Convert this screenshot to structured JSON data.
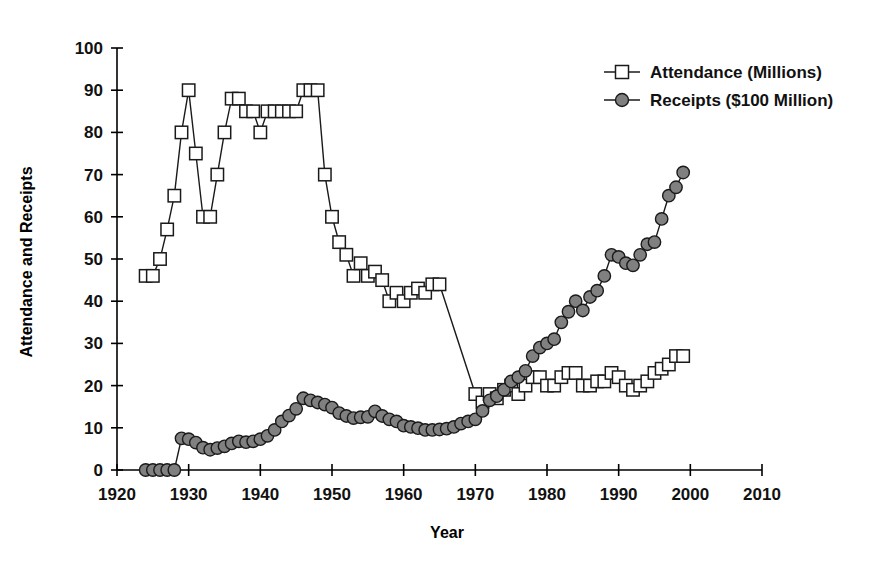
{
  "chart_data": {
    "type": "line",
    "title": "",
    "xlabel": "Year",
    "ylabel": "Attendance and Receipts",
    "xlim": [
      1920,
      2010
    ],
    "ylim": [
      0,
      100
    ],
    "xticks": [
      1920,
      1930,
      1940,
      1950,
      1960,
      1970,
      1980,
      1990,
      2000,
      2010
    ],
    "yticks": [
      0,
      10,
      20,
      30,
      40,
      50,
      60,
      70,
      80,
      90,
      100
    ],
    "grid": false,
    "legend_position": "top-right",
    "series": [
      {
        "name": "Attendance (Millions)",
        "marker": "open-square",
        "marker_color": "#ffffff",
        "line_color": "#1a1a1a",
        "x": [
          1924,
          1925,
          1926,
          1927,
          1928,
          1929,
          1930,
          1931,
          1932,
          1933,
          1934,
          1935,
          1936,
          1937,
          1938,
          1939,
          1940,
          1941,
          1942,
          1943,
          1944,
          1945,
          1946,
          1947,
          1948,
          1949,
          1950,
          1951,
          1952,
          1953,
          1954,
          1955,
          1956,
          1957,
          1958,
          1959,
          1960,
          1961,
          1962,
          1963,
          1964,
          1965,
          1970,
          1971,
          1972,
          1973,
          1974,
          1975,
          1976,
          1977,
          1978,
          1979,
          1980,
          1981,
          1982,
          1983,
          1984,
          1985,
          1986,
          1987,
          1988,
          1989,
          1990,
          1991,
          1992,
          1993,
          1994,
          1995,
          1996,
          1997,
          1998,
          1999
        ],
        "y": [
          46,
          46,
          50,
          57,
          65,
          80,
          90,
          75,
          60,
          60,
          70,
          80,
          88,
          88,
          85,
          85,
          80,
          85,
          85,
          85,
          85,
          85,
          90,
          90,
          90,
          70,
          60,
          54,
          51,
          46,
          49,
          46,
          47,
          45,
          40,
          42,
          40,
          42,
          43,
          42,
          44,
          44,
          18,
          16,
          18,
          17,
          19,
          20,
          18,
          20,
          22,
          22,
          20,
          20,
          22,
          23,
          23,
          20,
          20,
          21,
          21,
          23,
          22,
          20,
          19,
          20,
          21,
          23,
          24,
          25,
          27,
          27
        ]
      },
      {
        "name": "Receipts ($100 Million)",
        "marker": "filled-circle",
        "marker_color": "#808080",
        "line_color": "#1a1a1a",
        "x": [
          1924,
          1925,
          1926,
          1927,
          1928,
          1929,
          1930,
          1931,
          1932,
          1933,
          1934,
          1935,
          1936,
          1937,
          1938,
          1939,
          1940,
          1941,
          1942,
          1943,
          1944,
          1945,
          1946,
          1947,
          1948,
          1949,
          1950,
          1951,
          1952,
          1953,
          1954,
          1955,
          1956,
          1957,
          1958,
          1959,
          1960,
          1961,
          1962,
          1963,
          1964,
          1965,
          1966,
          1967,
          1968,
          1969,
          1970,
          1971,
          1972,
          1973,
          1974,
          1975,
          1976,
          1977,
          1978,
          1979,
          1980,
          1981,
          1982,
          1983,
          1984,
          1985,
          1986,
          1987,
          1988,
          1989,
          1990,
          1991,
          1992,
          1993,
          1994,
          1995,
          1996,
          1997,
          1998,
          1999
        ],
        "y": [
          0,
          0,
          0,
          0,
          0,
          7.5,
          7.3,
          6.5,
          5.3,
          4.8,
          5.2,
          5.6,
          6.3,
          6.8,
          6.6,
          6.8,
          7.3,
          8.1,
          9.5,
          11.5,
          12.9,
          14.5,
          17.0,
          16.5,
          16.0,
          15.5,
          14.8,
          13.5,
          12.8,
          12.3,
          12.5,
          12.6,
          13.9,
          12.8,
          12.0,
          11.5,
          10.5,
          10.2,
          9.9,
          9.5,
          9.5,
          9.6,
          9.8,
          10.2,
          11.0,
          11.5,
          12.0,
          14.0,
          16.5,
          17.5,
          19.0,
          21.0,
          22.0,
          23.5,
          27.0,
          29.0,
          30.0,
          31.0,
          35.0,
          37.5,
          40.0,
          37.8,
          41.0,
          42.5,
          46.0,
          51.0,
          50.5,
          49.0,
          48.5,
          51.0,
          53.5,
          54.0,
          59.5,
          65.0,
          67.0,
          70.5
        ]
      }
    ]
  },
  "legend": {
    "items": [
      {
        "label": "Attendance (Millions)",
        "marker": "open-square"
      },
      {
        "label": "Receipts ($100 Million)",
        "marker": "filled-circle"
      }
    ]
  },
  "axes": {
    "x_title": "Year",
    "y_title": "Attendance and Receipts"
  }
}
